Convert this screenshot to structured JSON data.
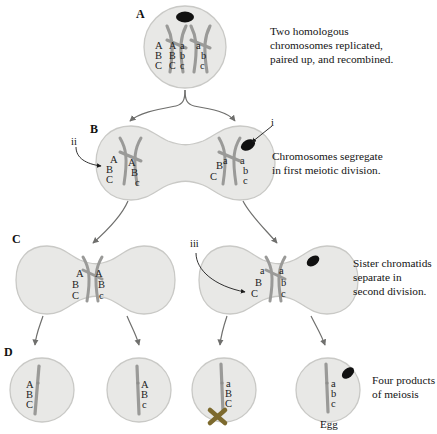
{
  "figure": {
    "colors": {
      "cell_fill": "#e8e8e6",
      "cell_stroke": "#c9c9c6",
      "chromatid": "#9a9a98",
      "polar_body": "#111111",
      "arrow": "#6f6f6d",
      "x_mark": "#7d6a2e",
      "text": "#1a1a1a"
    }
  },
  "stages": {
    "a": {
      "letter": "A",
      "caption": "Two homologous\nchromosomes replicated,\npaired up, and recombined.",
      "polar_body": true,
      "alleles": [
        {
          "name": "chromatid-1",
          "top": "A",
          "mid": "B",
          "bot": "C"
        },
        {
          "name": "chromatid-2",
          "top": "A",
          "mid": "B",
          "bot": "C"
        },
        {
          "name": "chromatid-3",
          "top": "a",
          "mid": "b",
          "bot": "c"
        },
        {
          "name": "chromatid-4",
          "top": "a",
          "mid": "b",
          "bot": "c"
        }
      ]
    },
    "b": {
      "letter": "B",
      "caption": "Chromosomes segregate\nin first meiotic division.",
      "marker_i": "i",
      "marker_ii": "ii",
      "polar_body": true,
      "left_cell": {
        "alleles": [
          {
            "name": "chromatid-1",
            "top": "A",
            "mid": "B",
            "bot": "C"
          },
          {
            "name": "chromatid-2",
            "top": "A",
            "mid": "B",
            "bot": "c"
          }
        ]
      },
      "right_cell": {
        "alleles": [
          {
            "name": "chromatid-1",
            "top": "a",
            "mid": "B",
            "bot": "C"
          },
          {
            "name": "chromatid-2",
            "top": "a",
            "mid": "b",
            "bot": "c"
          }
        ]
      }
    },
    "c": {
      "letter": "C",
      "caption": "Sister chromatids\nseparate in\nsecond division.",
      "marker_iii": "iii",
      "left_cell": {
        "alleles": [
          {
            "name": "chromatid-1",
            "top": "A",
            "mid": "B",
            "bot": "C"
          },
          {
            "name": "chromatid-2",
            "top": "A",
            "mid": "B",
            "bot": "c"
          }
        ]
      },
      "right_cell": {
        "polar_body": true,
        "alleles": [
          {
            "name": "chromatid-1",
            "top": "a",
            "mid": "B",
            "bot": "C"
          },
          {
            "name": "chromatid-2",
            "top": "a",
            "mid": "b",
            "bot": "c"
          }
        ]
      }
    },
    "d": {
      "letter": "D",
      "caption": "Four products\nof meiosis",
      "egg_label": "Egg",
      "products": [
        {
          "name": "product-1",
          "top": "A",
          "mid": "B",
          "bot": "C",
          "degenerate": false,
          "polar_body": false,
          "is_egg": false
        },
        {
          "name": "product-2",
          "top": "A",
          "mid": "B",
          "bot": "c",
          "degenerate": false,
          "polar_body": false,
          "is_egg": false
        },
        {
          "name": "product-3",
          "top": "a",
          "mid": "B",
          "bot": "C",
          "degenerate": true,
          "polar_body": false,
          "is_egg": false
        },
        {
          "name": "product-4",
          "top": "a",
          "mid": "b",
          "bot": "c",
          "degenerate": false,
          "polar_body": true,
          "is_egg": true
        }
      ]
    }
  }
}
